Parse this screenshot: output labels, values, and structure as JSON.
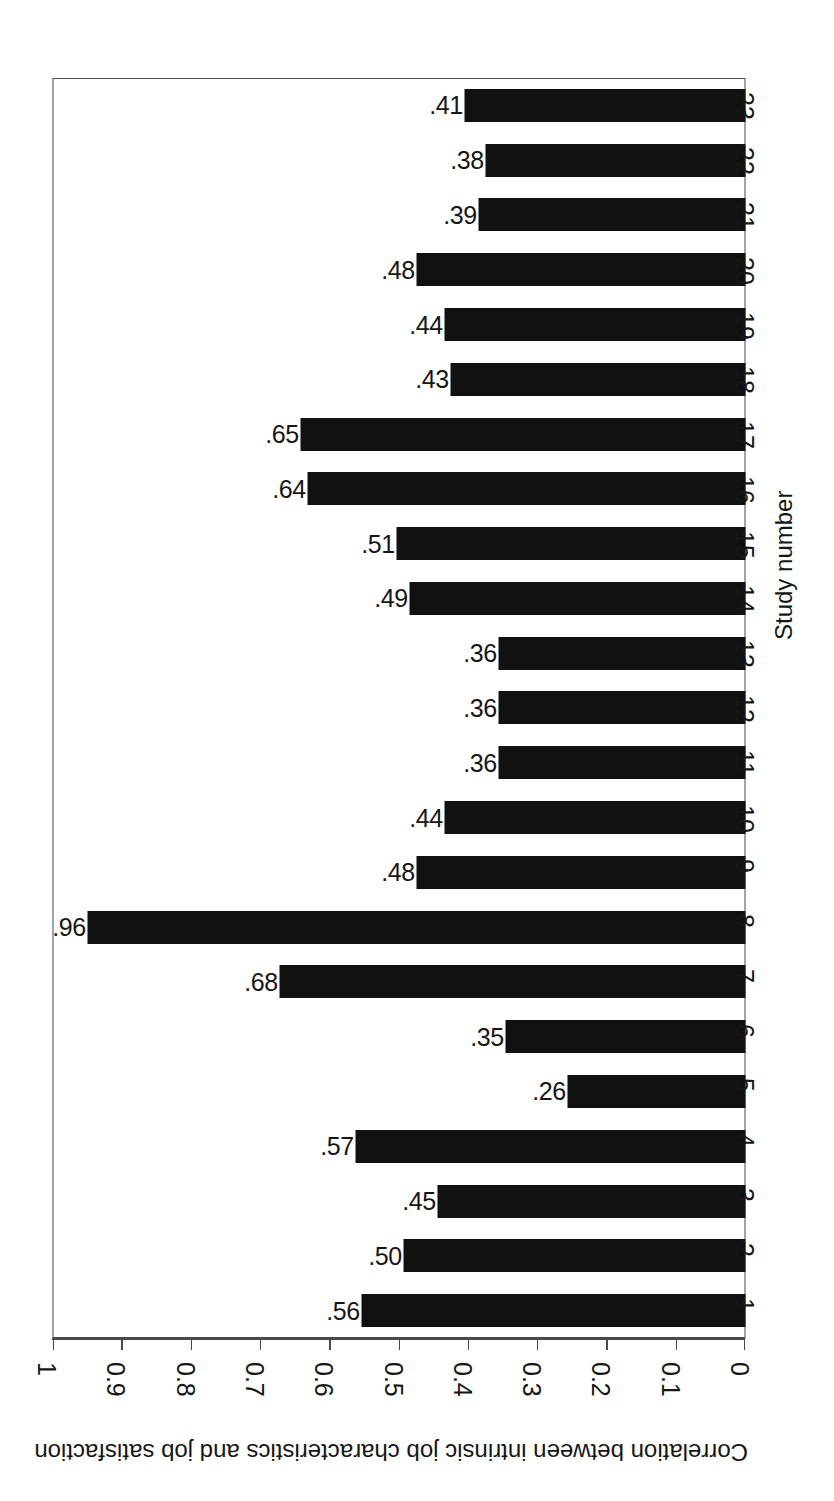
{
  "chart_data": {
    "type": "bar",
    "orientation": "vertical-rotated",
    "title": "",
    "xlabel": "Study number",
    "ylabel": "Correlation between intrinsic job characteristics and job satisfaction",
    "categories": [
      "1",
      "2",
      "3",
      "4",
      "5",
      "6",
      "7",
      "8",
      "9",
      "10",
      "11",
      "12",
      "13",
      "14",
      "15",
      "16",
      "17",
      "18",
      "19",
      "20",
      "21",
      "22",
      "23"
    ],
    "values": [
      0.56,
      0.5,
      0.45,
      0.57,
      0.26,
      0.35,
      0.68,
      0.96,
      0.48,
      0.44,
      0.36,
      0.36,
      0.36,
      0.49,
      0.51,
      0.64,
      0.65,
      0.43,
      0.44,
      0.48,
      0.39,
      0.38,
      0.41
    ],
    "data_labels": [
      ".56",
      ".50",
      ".45",
      ".57",
      ".26",
      ".35",
      ".68",
      ".96",
      ".48",
      ".44",
      ".36",
      ".36",
      ".36",
      ".49",
      ".51",
      ".64",
      ".65",
      ".43",
      ".44",
      ".48",
      ".39",
      ".38",
      ".41"
    ],
    "ylim": [
      0,
      1
    ],
    "ytick_labels": [
      "1",
      "0.9",
      "0.8",
      "0.7",
      "0.6",
      "0.5",
      "0.4",
      "0.3",
      "0.2",
      "0.1",
      "0"
    ],
    "ytick_values": [
      1,
      0.9,
      0.8,
      0.7,
      0.6,
      0.5,
      0.4,
      0.3,
      0.2,
      0.1,
      0
    ],
    "grid": false,
    "legend": null,
    "bar_color": "#111111",
    "axis_color": "#4a4a4a",
    "background_color": "#ffffff"
  },
  "axes": {
    "value_axis_title": "Correlation between intrinsic job characteristics and job satisfaction",
    "category_axis_title": "Study number"
  }
}
